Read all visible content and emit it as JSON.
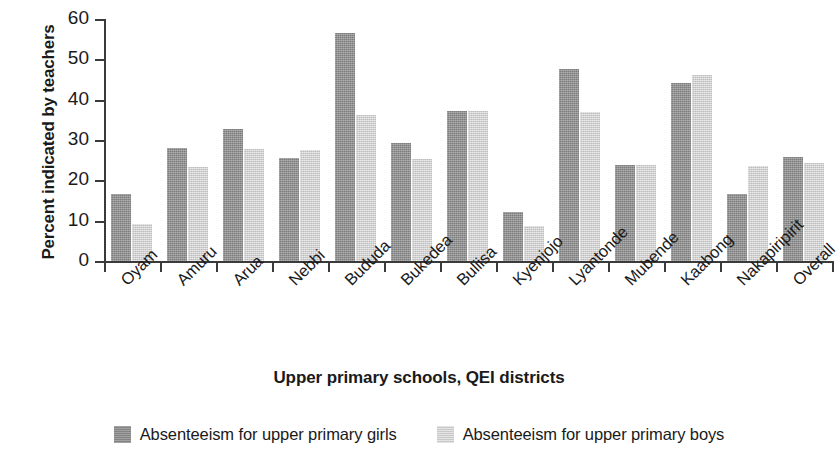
{
  "chart_data": {
    "type": "bar",
    "title": "",
    "xlabel": "Upper primary schools, QEI districts",
    "ylabel": "Percent indicated by teachers",
    "ylim": [
      0,
      60
    ],
    "yticks": [
      0,
      10,
      20,
      30,
      40,
      50,
      60
    ],
    "grid": false,
    "legend_position": "bottom",
    "categories": [
      "Oyam",
      "Amuru",
      "Arua",
      "Nebbi",
      "Bududa",
      "Bukedea",
      "Buliisa",
      "Kyenjojo",
      "Lyantonde",
      "Mubende",
      "Kaabong",
      "Nakapiripirit",
      "Overall"
    ],
    "series": [
      {
        "name": "Absenteeism for upper primary girls",
        "color": "#8d8d8d",
        "values": [
          16.5,
          27.9,
          32.7,
          25.6,
          56.5,
          29.2,
          37.3,
          12.2,
          47.5,
          23.9,
          44.2,
          16.5,
          25.7
        ]
      },
      {
        "name": "Absenteeism for upper primary boys",
        "color": "#d2d2d2",
        "values": [
          9.3,
          23.4,
          27.8,
          27.5,
          36.3,
          25.4,
          37.3,
          8.8,
          37.0,
          23.9,
          46.0,
          23.5,
          24.4
        ]
      }
    ]
  },
  "axis": {
    "y_title": "Percent indicated by teachers",
    "x_title": "Upper primary schools, QEI districts"
  },
  "legend": {
    "items": [
      {
        "label": "Absenteeism for upper primary girls",
        "swatch": "girls"
      },
      {
        "label": "Absenteeism for upper primary boys",
        "swatch": "boys"
      }
    ]
  }
}
